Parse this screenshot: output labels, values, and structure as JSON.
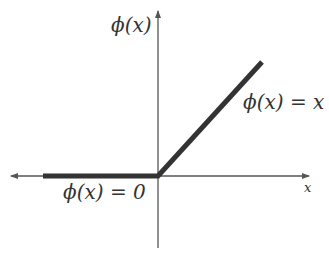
{
  "diagram": {
    "labels": {
      "y_axis": "ϕ(x)",
      "positive_branch": "ϕ(x) = x",
      "negative_branch": "ϕ(x) = 0",
      "x_axis": "x"
    },
    "colors": {
      "axis": "#555555",
      "curve": "#333333",
      "text": "#333333",
      "background": "#ffffff"
    },
    "geometry": {
      "origin": [
        158,
        176
      ],
      "x_axis": {
        "from": [
          12,
          176
        ],
        "to": [
          308,
          176
        ]
      },
      "y_axis": {
        "from": [
          158,
          248
        ],
        "to": [
          158,
          12
        ]
      },
      "relu_curve": [
        [
          43,
          176
        ],
        [
          158,
          176
        ],
        [
          262,
          62
        ]
      ]
    }
  }
}
